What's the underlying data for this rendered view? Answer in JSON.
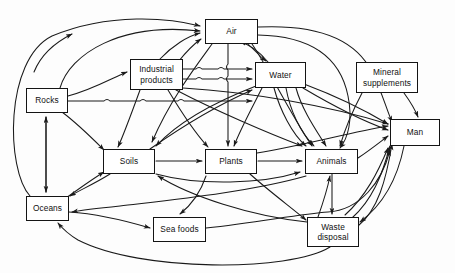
{
  "diagram": {
    "background_color": "#fdfdfd",
    "line_color": "#1a1a1a",
    "box_fill_color": "#ffffff",
    "box_border_color": "#141414",
    "nodes": [
      {
        "id": "air",
        "label": "Air",
        "x": 205,
        "y": 19,
        "w": 53,
        "h": 25
      },
      {
        "id": "industrial",
        "label": "Industrial\nproducts",
        "x": 130,
        "y": 59,
        "w": 53,
        "h": 31
      },
      {
        "id": "water",
        "label": "Water",
        "x": 255,
        "y": 62,
        "w": 51,
        "h": 26
      },
      {
        "id": "mineral",
        "label": "Mineral\nsupplements",
        "x": 356,
        "y": 62,
        "w": 62,
        "h": 31
      },
      {
        "id": "rocks",
        "label": "Rocks",
        "x": 26,
        "y": 88,
        "w": 42,
        "h": 25
      },
      {
        "id": "man",
        "label": "Man",
        "x": 390,
        "y": 119,
        "w": 50,
        "h": 27
      },
      {
        "id": "soils",
        "label": "Soils",
        "x": 103,
        "y": 149,
        "w": 52,
        "h": 25
      },
      {
        "id": "plants",
        "label": "Plants",
        "x": 205,
        "y": 149,
        "w": 52,
        "h": 25
      },
      {
        "id": "animals",
        "label": "Animals",
        "x": 305,
        "y": 149,
        "w": 53,
        "h": 25
      },
      {
        "id": "oceans",
        "label": "Oceans",
        "x": 26,
        "y": 196,
        "w": 43,
        "h": 25
      },
      {
        "id": "seafoods",
        "label": "Sea  foods",
        "x": 153,
        "y": 217,
        "w": 53,
        "h": 25
      },
      {
        "id": "waste",
        "label": "Waste\ndisposal",
        "x": 307,
        "y": 217,
        "w": 52,
        "h": 30
      }
    ],
    "edges": [
      {
        "from": "oceans",
        "to": "air",
        "note": "long left outer curve up to Air"
      },
      {
        "from": "rocks",
        "to": "air",
        "note": "curve up right to Air"
      },
      {
        "from": "rocks",
        "to": "industrial",
        "note": "left into Industrial products"
      },
      {
        "from": "rocks",
        "to": "water",
        "note": "horizontal right through crossings"
      },
      {
        "from": "rocks",
        "to": "oceans",
        "note": "bidirectional vertical"
      },
      {
        "from": "oceans",
        "to": "rocks",
        "note": "bidirectional vertical"
      },
      {
        "from": "rocks",
        "to": "soils",
        "note": "down-right to Soils"
      },
      {
        "from": "oceans",
        "to": "soils",
        "note": "up-right to Soils"
      },
      {
        "from": "soils",
        "to": "oceans",
        "note": "down-left to Oceans"
      },
      {
        "from": "industrial",
        "to": "air",
        "note": "up-right to Air"
      },
      {
        "from": "industrial",
        "to": "water",
        "note": "two horizontal arrows"
      },
      {
        "from": "industrial",
        "to": "soils",
        "note": "down-left to Soils"
      },
      {
        "from": "industrial",
        "to": "plants",
        "note": "down-right to Plants"
      },
      {
        "from": "industrial",
        "to": "animals",
        "note": "down-right to Animals"
      },
      {
        "from": "industrial",
        "to": "man",
        "note": "long right to Man"
      },
      {
        "from": "air",
        "to": "water",
        "note": "down-right to Water"
      },
      {
        "from": "air",
        "to": "plants",
        "note": "straight down to Plants"
      },
      {
        "from": "air",
        "to": "soils",
        "note": "down-left to Soils"
      },
      {
        "from": "air",
        "to": "animals",
        "note": "down-right to Animals"
      },
      {
        "from": "air",
        "to": "man",
        "note": "outer right curve to Man"
      },
      {
        "from": "water",
        "to": "air",
        "note": "up-left back to Air"
      },
      {
        "from": "water",
        "to": "soils",
        "note": "down-left to Soils"
      },
      {
        "from": "water",
        "to": "plants",
        "note": "down-left to Plants"
      },
      {
        "from": "water",
        "to": "animals",
        "note": "down-right to Animals"
      },
      {
        "from": "water",
        "to": "man",
        "note": "down-right to Man"
      },
      {
        "from": "soils",
        "to": "plants",
        "note": "horizontal right"
      },
      {
        "from": "soils",
        "to": "animals",
        "note": "lower curve right to Animals"
      },
      {
        "from": "soils",
        "to": "water",
        "note": "up-right to Water"
      },
      {
        "from": "plants",
        "to": "animals",
        "note": "horizontal right"
      },
      {
        "from": "plants",
        "to": "man",
        "note": "up-right to Man"
      },
      {
        "from": "plants",
        "to": "waste",
        "note": "down-right to Waste disposal"
      },
      {
        "from": "animals",
        "to": "man",
        "note": "right to Man"
      },
      {
        "from": "animals",
        "to": "waste",
        "note": "down to Waste disposal"
      },
      {
        "from": "mineral",
        "to": "animals",
        "note": "down-left to Animals"
      },
      {
        "from": "mineral",
        "to": "man",
        "note": "down-right to Man"
      },
      {
        "from": "man",
        "to": "waste",
        "note": "curve down-left to Waste disposal"
      },
      {
        "from": "waste",
        "to": "man",
        "note": "curves up-right to Man"
      },
      {
        "from": "waste",
        "to": "soils",
        "note": "left curve to Soils"
      },
      {
        "from": "waste",
        "to": "oceans",
        "note": "long bottom curve to Oceans"
      },
      {
        "from": "waste",
        "to": "animals",
        "note": "up-left to Animals"
      },
      {
        "from": "oceans",
        "to": "seafoods",
        "note": "horizontal right to Sea foods"
      },
      {
        "from": "seafoods",
        "to": "man",
        "note": "curve right to Man"
      },
      {
        "from": "plants",
        "to": "seafoods",
        "note": "curve down-left"
      },
      {
        "from": "animals",
        "to": "oceans",
        "note": "long return path"
      }
    ]
  }
}
